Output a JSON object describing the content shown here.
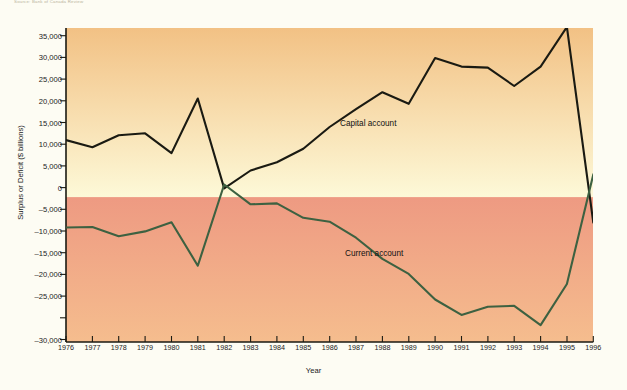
{
  "source_note": "Source: Bank of Canada Review",
  "axes": {
    "y_title": "Surplus or Deficit ($ billions)",
    "x_title": "Year",
    "y_ticks": [
      "35,000",
      "30,000",
      "25,000",
      "20,000",
      "15,000",
      "10,000",
      "5,000",
      "0",
      "–5,000",
      "–10,000",
      "–15,000",
      "–20,000",
      "–25,000",
      "–30,000"
    ],
    "x_ticks": [
      "1976",
      "1977",
      "1978",
      "1979",
      "1980",
      "1981",
      "1982",
      "1983",
      "1984",
      "1985",
      "1986",
      "1987",
      "1988",
      "1989",
      "1990",
      "1991",
      "1992",
      "1993",
      "1994",
      "1995",
      "1996"
    ]
  },
  "legend": {
    "capital": "Capital account",
    "current": "Current account"
  },
  "colors": {
    "capital_line": "#1a1a12",
    "current_line": "#3d6141",
    "positive_band_top": "#f2c184",
    "positive_band_bottom": "#fcf7d2",
    "negative_band_top": "#ef9d84",
    "negative_band_bottom": "#f4bb8c",
    "axis": "#1a1a12",
    "page_background": "#fdfcf3"
  },
  "chart_data": {
    "type": "line",
    "title": "",
    "xlabel": "Year",
    "ylabel": "Surplus or Deficit ($ billions)",
    "xlim": [
      1976,
      1996
    ],
    "ylim": [
      -30000,
      35000
    ],
    "ytick_interval": 5000,
    "grid": false,
    "legend_position": "inline-annotation",
    "zero_line": 0,
    "x": [
      1976,
      1977,
      1978,
      1979,
      1980,
      1981,
      1982,
      1983,
      1984,
      1985,
      1986,
      1987,
      1988,
      1989,
      1990,
      1991,
      1992,
      1993,
      1994,
      1995,
      1996
    ],
    "series": [
      {
        "name": "Capital account",
        "color": "#1a1a12",
        "values": [
          11800,
          10300,
          12800,
          13200,
          9100,
          20400,
          1800,
          5500,
          7200,
          10000,
          14500,
          18200,
          21700,
          19300,
          28800,
          27000,
          26800,
          23000,
          27000,
          35200,
          -5300
        ]
      },
      {
        "name": "Current account",
        "color": "#3d6141",
        "values": [
          -6300,
          -6200,
          -8100,
          -7100,
          -5200,
          -14200,
          2600,
          -1500,
          -1300,
          -4300,
          -5100,
          -8400,
          -12800,
          -15900,
          -21200,
          -24400,
          -22700,
          -22500,
          -26500,
          -18000,
          4700
        ]
      }
    ]
  }
}
